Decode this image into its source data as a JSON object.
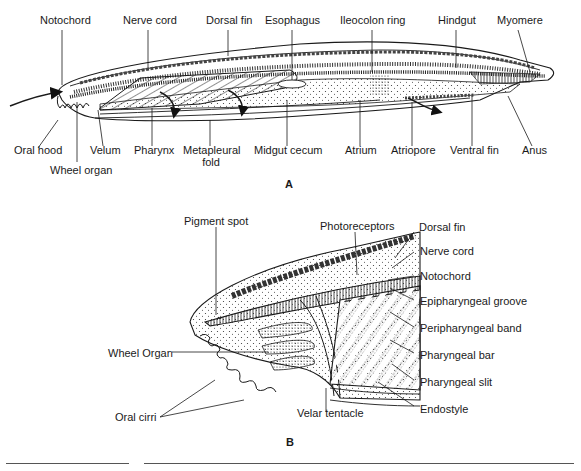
{
  "figure": {
    "panel_a": {
      "letter": "A",
      "top_labels": [
        "Notochord",
        "Nerve cord",
        "Dorsal fin",
        "Esophagus",
        "Ileocolon ring",
        "Hindgut",
        "Myomere"
      ],
      "bottom_labels": [
        "Oral hood",
        "Wheel organ",
        "Velum",
        "Pharynx",
        "Metapleural fold",
        "Midgut cecum",
        "Atrium",
        "Atriopore",
        "Ventral fin",
        "Anus"
      ]
    },
    "panel_b": {
      "letter": "B",
      "labels": {
        "pigment_spot": "Pigment spot",
        "photoreceptors": "Photoreceptors",
        "dorsal_fin": "Dorsal fin",
        "nerve_cord": "Nerve cord",
        "notochord": "Notochord",
        "epipharyngeal_groove": "Epipharyngeal groove",
        "peripharyngeal_band": "Peripharyngeal band",
        "pharyngeal_bar": "Pharyngeal bar",
        "pharyngeal_slit": "Pharyngeal slit",
        "endostyle": "Endostyle",
        "velar_tentacle": "Velar tentacle",
        "wheel_organ": "Wheel Organ",
        "oral_cirri": "Oral cirri"
      }
    }
  }
}
